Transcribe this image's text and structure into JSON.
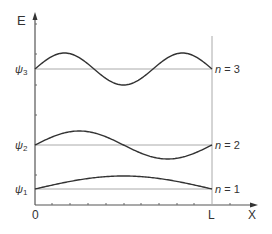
{
  "diagram": {
    "axes": {
      "y_label": "E",
      "x_label": "X",
      "x_origin_label": "0",
      "x_end_label": "L"
    },
    "levels": [
      {
        "n": 3,
        "psi_label": "ψ",
        "psi_sub": "3",
        "n_label": "n",
        "n_eq": " = 3",
        "half_waves": 3
      },
      {
        "n": 2,
        "psi_label": "ψ",
        "psi_sub": "2",
        "n_label": "n",
        "n_eq": " = 2",
        "half_waves": 2
      },
      {
        "n": 1,
        "psi_label": "ψ",
        "psi_sub": "1",
        "n_label": "n",
        "n_eq": " = 1",
        "half_waves": 1
      }
    ],
    "colors": {
      "axis": "#555555",
      "baseline": "#aaaaaa",
      "wave": "#333333",
      "text": "#333333"
    }
  }
}
